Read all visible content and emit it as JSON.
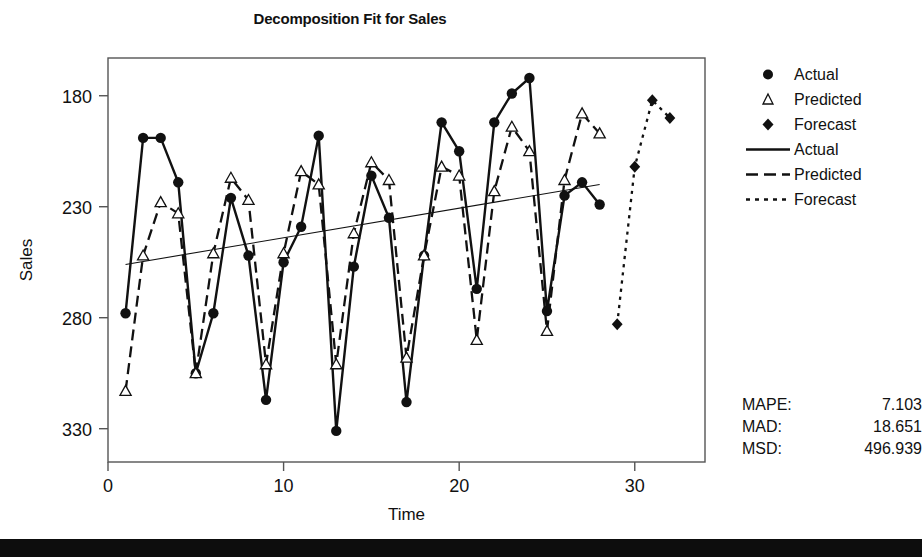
{
  "chart_data": {
    "type": "line",
    "title": "Decomposition Fit for Sales",
    "xlabel": "Time",
    "ylabel": "Sales",
    "xlim": [
      0,
      34
    ],
    "ylim": [
      165,
      347
    ],
    "xticks": [
      0,
      10,
      20,
      30
    ],
    "yticks": [
      180,
      230,
      280,
      330
    ],
    "grid": false,
    "legend_position": "right",
    "x": [
      1,
      2,
      3,
      4,
      5,
      6,
      7,
      8,
      9,
      10,
      11,
      12,
      13,
      14,
      15,
      16,
      17,
      18,
      19,
      20,
      21,
      22,
      23,
      24,
      25,
      26,
      27,
      28
    ],
    "series": [
      {
        "name": "Actual",
        "marker": "filled-circle",
        "line": "solid",
        "x": [
          1,
          2,
          3,
          4,
          5,
          6,
          7,
          8,
          9,
          10,
          11,
          12,
          13,
          14,
          15,
          16,
          17,
          18,
          19,
          20,
          21,
          22,
          23,
          24,
          25,
          26,
          27,
          28
        ],
        "values": [
          232,
          311,
          311,
          291,
          205,
          232,
          284,
          258,
          193,
          255,
          271,
          312,
          179,
          253,
          294,
          275,
          192,
          258,
          318,
          305,
          243,
          318,
          331,
          338,
          233,
          285,
          291,
          281
        ]
      },
      {
        "name": "Predicted",
        "marker": "open-triangle",
        "line": "dashed",
        "x": [
          1,
          2,
          3,
          4,
          5,
          6,
          7,
          8,
          9,
          10,
          11,
          12,
          13,
          14,
          15,
          16,
          17,
          18,
          19,
          20,
          21,
          22,
          23,
          24,
          25,
          26,
          27,
          28
        ],
        "values": [
          197,
          258,
          282,
          277,
          205,
          259,
          293,
          283,
          209,
          259,
          296,
          290,
          209,
          268,
          300,
          292,
          212,
          258,
          298,
          294,
          220,
          287,
          316,
          305,
          224,
          292,
          322,
          313
        ]
      },
      {
        "name": "Forecast",
        "marker": "filled-diamond",
        "line": "dotted",
        "x": [
          29,
          30,
          31,
          32
        ],
        "values": [
          227,
          298,
          328,
          320
        ]
      },
      {
        "name": "Trend",
        "marker": "none",
        "line": "thin-solid",
        "x": [
          1,
          28
        ],
        "values": [
          254,
          290
        ]
      }
    ]
  },
  "legend": {
    "items": [
      {
        "label": "Actual",
        "symbol": "filled-circle"
      },
      {
        "label": "Predicted",
        "symbol": "open-triangle"
      },
      {
        "label": "Forecast",
        "symbol": "filled-diamond"
      },
      {
        "label": "Actual",
        "symbol": "solid-line"
      },
      {
        "label": "Predicted",
        "symbol": "dashed-line"
      },
      {
        "label": "Forecast",
        "symbol": "dotted-line"
      }
    ]
  },
  "accuracy_measures": {
    "rows": [
      {
        "name": "MAPE:",
        "value": "7.103"
      },
      {
        "name": "MAD:",
        "value": "18.651"
      },
      {
        "name": "MSD:",
        "value": "496.939"
      }
    ]
  },
  "axis_labels": {
    "x": "Time",
    "y": "Sales",
    "xticks": [
      "0",
      "10",
      "20",
      "30"
    ],
    "yticks": [
      "330",
      "280",
      "230",
      "180"
    ]
  },
  "colors": {
    "ink": "#111111",
    "frame": "#555555",
    "background": "#ffffff",
    "footer": "#0d0d0d"
  }
}
